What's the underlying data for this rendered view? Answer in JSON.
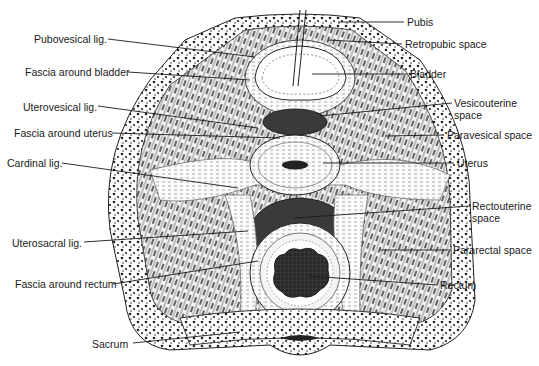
{
  "figure": {
    "colors": {
      "ink": "#1a1a1a",
      "background": "#ffffff",
      "dense": "#2b2b2b",
      "light": "#e8e8e8"
    }
  },
  "labels_left": [
    {
      "id": "pubovesical",
      "text": "Pubovesical lig.",
      "x": 34,
      "y": 33,
      "tx": 255,
      "ty": 57
    },
    {
      "id": "fascia_bladder",
      "text": "Fascia around bladder",
      "x": 25,
      "y": 66,
      "tx": 250,
      "ty": 80
    },
    {
      "id": "uterovesical",
      "text": "Uterovesical lig.",
      "x": 23,
      "y": 101,
      "tx": 258,
      "ty": 128
    },
    {
      "id": "fascia_uterus",
      "text": "Fascia around uterus",
      "x": 14,
      "y": 127,
      "tx": 280,
      "ty": 138
    },
    {
      "id": "cardinal",
      "text": "Cardinal lig.",
      "x": 7,
      "y": 157,
      "tx": 238,
      "ty": 188
    },
    {
      "id": "uterosacral",
      "text": "Uterosacral lig.",
      "x": 12,
      "y": 237,
      "tx": 248,
      "ty": 231
    },
    {
      "id": "fascia_rectum",
      "text": "Fascia around rectum",
      "x": 15,
      "y": 278,
      "tx": 258,
      "ty": 261
    },
    {
      "id": "sacrum",
      "text": "Sacrum",
      "x": 92,
      "y": 338,
      "tx": 240,
      "ty": 332
    }
  ],
  "labels_right": [
    {
      "id": "pubis",
      "text": "Pubis",
      "x": 407,
      "y": 16,
      "tx": 338,
      "ty": 22
    },
    {
      "id": "retropubic",
      "text": "Retropubic space",
      "x": 405,
      "y": 38,
      "tx": 328,
      "ty": 40
    },
    {
      "id": "bladder",
      "text": "Bladder",
      "x": 410,
      "y": 68,
      "tx": 312,
      "ty": 74
    },
    {
      "id": "vesicouterine",
      "text": "Vesicouterine space",
      "x": 454,
      "y": 97,
      "tx": 320,
      "ty": 116
    },
    {
      "id": "paravesical",
      "text": "Paravesical space",
      "x": 447,
      "y": 129,
      "tx": 385,
      "ty": 136
    },
    {
      "id": "uterus",
      "text": "Uterus",
      "x": 457,
      "y": 157,
      "tx": 323,
      "ty": 163
    },
    {
      "id": "rectouterine",
      "text": "Rectouterine space",
      "x": 472,
      "y": 200,
      "tx": 294,
      "ty": 218
    },
    {
      "id": "pararectal",
      "text": "Pararectal space",
      "x": 453,
      "y": 244,
      "tx": 380,
      "ty": 250
    },
    {
      "id": "rectum",
      "text": "Rectum",
      "x": 440,
      "y": 279,
      "tx": 308,
      "ty": 276
    }
  ]
}
